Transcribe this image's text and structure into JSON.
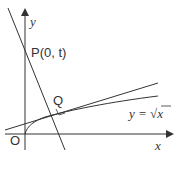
{
  "diagram": {
    "y_axis_label": "y",
    "x_axis_label": "x",
    "origin_label": "O",
    "point_p_label": "P(0, t)",
    "point_q_label": "Q",
    "curve_label_lhs": "y = ",
    "curve_label_sqrt_arg": "x",
    "curve_equation": "y = √x",
    "colors": {
      "stroke": "#333333",
      "background": "#ffffff"
    }
  }
}
